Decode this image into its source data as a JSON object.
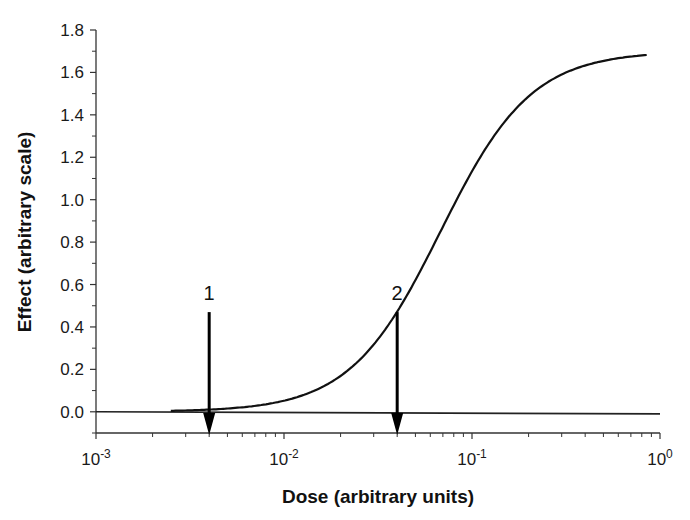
{
  "chart_data": {
    "type": "line",
    "title": "",
    "xlabel": "Dose (arbitrary units)",
    "ylabel": "Effect (arbitrary scale)",
    "xscale": "log",
    "xlim": [
      0.001,
      1
    ],
    "ylim": [
      -0.1,
      1.8
    ],
    "grid": false,
    "legend": "none",
    "xticks": [
      {
        "value": 0.001,
        "base": "10",
        "exp": "-3"
      },
      {
        "value": 0.01,
        "base": "10",
        "exp": "-2"
      },
      {
        "value": 0.1,
        "base": "10",
        "exp": "-1"
      },
      {
        "value": 1,
        "base": "10",
        "exp": "0"
      }
    ],
    "yticks": [
      {
        "value": 0.0,
        "label": "0.0"
      },
      {
        "value": 0.2,
        "label": "0.2"
      },
      {
        "value": 0.4,
        "label": "0.4"
      },
      {
        "value": 0.6,
        "label": "0.6"
      },
      {
        "value": 0.8,
        "label": "0.8"
      },
      {
        "value": 1.0,
        "label": "1.0"
      },
      {
        "value": 1.2,
        "label": "1.2"
      },
      {
        "value": 1.4,
        "label": "1.4"
      },
      {
        "value": 1.6,
        "label": "1.6"
      },
      {
        "value": 1.8,
        "label": "1.8"
      }
    ],
    "series": [
      {
        "name": "dose-response",
        "model": "hill",
        "emax": 1.7,
        "ec50": 0.068,
        "hill": 1.8,
        "x_range": [
          0.0025,
          0.85
        ]
      },
      {
        "name": "baseline",
        "x": [
          0.001,
          1
        ],
        "y": [
          0.0,
          -0.01
        ]
      }
    ],
    "annotations": [
      {
        "label": "1",
        "x": 0.004,
        "y_top": 0.47,
        "type": "down-arrow"
      },
      {
        "label": "2",
        "x": 0.04,
        "y_top": 0.47,
        "type": "down-arrow"
      }
    ]
  }
}
